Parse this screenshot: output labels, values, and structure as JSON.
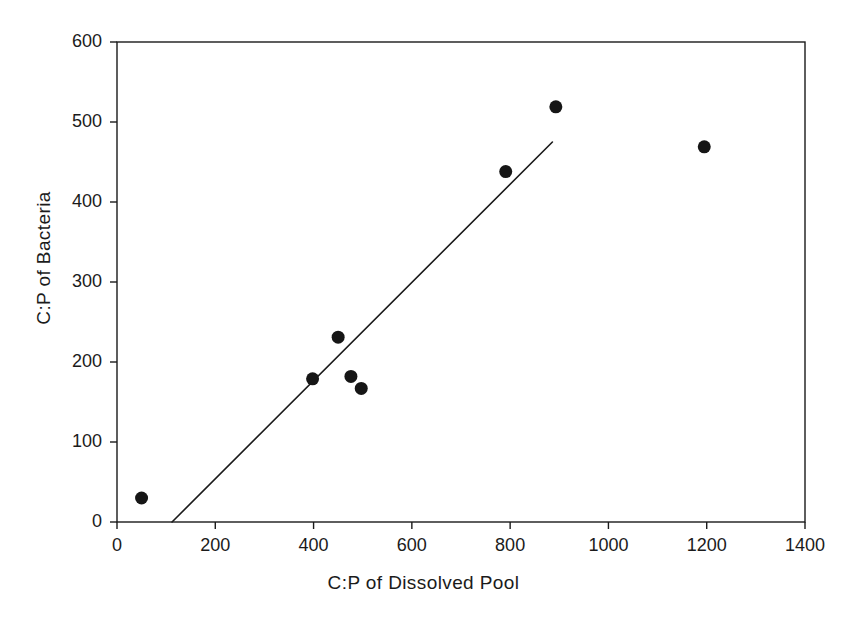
{
  "chart_data": {
    "type": "scatter",
    "title": "",
    "xlabel": "C:P of Dissolved Pool",
    "ylabel": "C:P of Bacteria",
    "xlim": [
      0,
      1400
    ],
    "ylim": [
      0,
      600
    ],
    "xticks": [
      0,
      200,
      400,
      600,
      800,
      1000,
      1200,
      1400
    ],
    "yticks": [
      0,
      100,
      200,
      300,
      400,
      500,
      600
    ],
    "xtick_labels": [
      "0",
      "200",
      "400",
      "600",
      "800",
      "1000",
      "1200",
      "1400"
    ],
    "ytick_labels": [
      "0",
      "100",
      "200",
      "300",
      "400",
      "500",
      "600"
    ],
    "grid": false,
    "legend": false,
    "marker": {
      "shape": "filled-circle",
      "color": "#161616",
      "size_px": 13
    },
    "series": [
      {
        "name": "C:P of Bacteria vs C:P of Dissolved Pool",
        "points": [
          {
            "x": 50,
            "y": 30
          },
          {
            "x": 398,
            "y": 179
          },
          {
            "x": 450,
            "y": 231
          },
          {
            "x": 476,
            "y": 182
          },
          {
            "x": 497,
            "y": 167
          },
          {
            "x": 791,
            "y": 438
          },
          {
            "x": 893,
            "y": 519
          },
          {
            "x": 1195,
            "y": 469
          }
        ]
      }
    ],
    "trendline": {
      "name": "regression-line",
      "color": "#1a1a1a",
      "width_px": 1.6,
      "x_start": 112,
      "y_start": 0,
      "x_end": 886,
      "y_end": 475
    }
  },
  "axes": {
    "frame_color": "#1a1a1a",
    "frame_width_px": 1.4,
    "tick_length_px": 7,
    "background": "#ffffff"
  }
}
